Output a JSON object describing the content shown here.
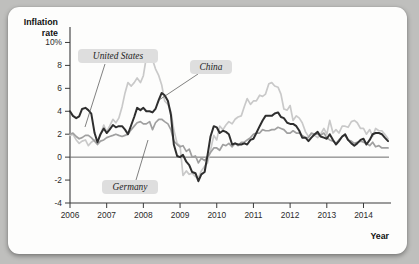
{
  "figure": {
    "background_color": "#bfbfbd",
    "card_color": "#fdfdfc"
  },
  "chart_data": {
    "type": "line",
    "title": "",
    "xlabel": "Year",
    "ylabel": "Inflation rate",
    "ylabel_line1": "Inflation",
    "ylabel_line2": "rate",
    "xlim": [
      2006,
      2014.75
    ],
    "ylim": [
      -4,
      11
    ],
    "grid": false,
    "zero_line": true,
    "legend_position": "inline-annotations",
    "ytick_labels": [
      "10%",
      "8",
      "6",
      "4",
      "2",
      "0",
      "-2",
      "-4"
    ],
    "ytick_values": [
      10,
      8,
      6,
      4,
      2,
      0,
      -2,
      -4
    ],
    "xtick_labels": [
      "2006",
      "2007",
      "2008",
      "2009",
      "2010",
      "2011",
      "2012",
      "2013",
      "2014"
    ],
    "xtick_values": [
      2006,
      2007,
      2008,
      2009,
      2010,
      2011,
      2012,
      2013,
      2014
    ],
    "annotations": [
      {
        "label": "United States",
        "series": "United States"
      },
      {
        "label": "China",
        "series": "China"
      },
      {
        "label": "Germany",
        "series": "Germany"
      }
    ],
    "series": [
      {
        "name": "United States",
        "color": "#2e2e2e",
        "x": [
          2006.0,
          2006.08,
          2006.17,
          2006.25,
          2006.33,
          2006.42,
          2006.5,
          2006.58,
          2006.67,
          2006.75,
          2006.83,
          2006.92,
          2007.0,
          2007.08,
          2007.17,
          2007.25,
          2007.33,
          2007.42,
          2007.5,
          2007.58,
          2007.67,
          2007.75,
          2007.83,
          2007.92,
          2008.0,
          2008.08,
          2008.17,
          2008.25,
          2008.33,
          2008.42,
          2008.5,
          2008.58,
          2008.67,
          2008.75,
          2008.83,
          2008.92,
          2009.0,
          2009.08,
          2009.17,
          2009.25,
          2009.33,
          2009.42,
          2009.5,
          2009.58,
          2009.67,
          2009.75,
          2009.83,
          2009.92,
          2010.0,
          2010.08,
          2010.17,
          2010.25,
          2010.33,
          2010.42,
          2010.5,
          2010.58,
          2010.67,
          2010.75,
          2010.83,
          2010.92,
          2011.0,
          2011.08,
          2011.17,
          2011.25,
          2011.33,
          2011.42,
          2011.5,
          2011.58,
          2011.67,
          2011.75,
          2011.83,
          2011.92,
          2012.0,
          2012.08,
          2012.17,
          2012.25,
          2012.33,
          2012.42,
          2012.5,
          2012.58,
          2012.67,
          2012.75,
          2012.83,
          2012.92,
          2013.0,
          2013.08,
          2013.17,
          2013.25,
          2013.33,
          2013.42,
          2013.5,
          2013.58,
          2013.67,
          2013.75,
          2013.83,
          2013.92,
          2014.0,
          2014.08,
          2014.17,
          2014.25,
          2014.33,
          2014.42,
          2014.5,
          2014.58,
          2014.67
        ],
        "y": [
          4.0,
          3.6,
          3.4,
          3.55,
          4.2,
          4.3,
          4.1,
          3.8,
          2.1,
          1.3,
          2.0,
          2.5,
          2.1,
          2.4,
          2.8,
          2.6,
          2.7,
          2.7,
          2.4,
          2.0,
          2.8,
          3.5,
          4.3,
          4.1,
          4.3,
          4.0,
          4.0,
          3.9,
          4.2,
          5.0,
          5.6,
          5.4,
          4.9,
          3.7,
          1.1,
          0.1,
          0.0,
          0.2,
          -0.4,
          -0.7,
          -1.3,
          -1.4,
          -2.1,
          -1.5,
          -1.3,
          0.2,
          1.8,
          2.7,
          2.6,
          2.1,
          2.3,
          2.2,
          2.0,
          1.1,
          1.2,
          1.1,
          1.1,
          1.2,
          1.1,
          1.5,
          1.6,
          2.1,
          2.7,
          3.2,
          3.6,
          3.6,
          3.6,
          3.8,
          3.9,
          3.5,
          3.4,
          3.0,
          2.9,
          2.9,
          2.7,
          2.3,
          1.7,
          1.7,
          1.4,
          1.7,
          2.0,
          2.2,
          1.8,
          1.7,
          1.6,
          2.0,
          1.5,
          1.1,
          1.4,
          1.8,
          2.0,
          1.5,
          1.2,
          1.0,
          1.2,
          1.5,
          1.6,
          1.1,
          1.5,
          2.0,
          2.1,
          2.1,
          2.0,
          1.7,
          1.4
        ]
      },
      {
        "name": "China",
        "color": "#c9c9c9",
        "x": [
          2006.0,
          2006.08,
          2006.17,
          2006.25,
          2006.33,
          2006.42,
          2006.5,
          2006.58,
          2006.67,
          2006.75,
          2006.83,
          2006.92,
          2007.0,
          2007.08,
          2007.17,
          2007.25,
          2007.33,
          2007.42,
          2007.5,
          2007.58,
          2007.67,
          2007.75,
          2007.83,
          2007.92,
          2008.0,
          2008.08,
          2008.17,
          2008.25,
          2008.33,
          2008.42,
          2008.5,
          2008.58,
          2008.67,
          2008.75,
          2008.83,
          2008.92,
          2009.0,
          2009.08,
          2009.17,
          2009.25,
          2009.33,
          2009.42,
          2009.5,
          2009.58,
          2009.67,
          2009.75,
          2009.83,
          2009.92,
          2010.0,
          2010.08,
          2010.17,
          2010.25,
          2010.33,
          2010.42,
          2010.5,
          2010.58,
          2010.67,
          2010.75,
          2010.83,
          2010.92,
          2011.0,
          2011.08,
          2011.17,
          2011.25,
          2011.33,
          2011.42,
          2011.5,
          2011.58,
          2011.67,
          2011.75,
          2011.83,
          2011.92,
          2012.0,
          2012.08,
          2012.17,
          2012.25,
          2012.33,
          2012.42,
          2012.5,
          2012.58,
          2012.67,
          2012.75,
          2012.83,
          2012.92,
          2013.0,
          2013.08,
          2013.17,
          2013.25,
          2013.33,
          2013.42,
          2013.5,
          2013.58,
          2013.67,
          2013.75,
          2013.83,
          2013.92,
          2014.0,
          2014.08,
          2014.17,
          2014.25,
          2014.33,
          2014.42,
          2014.5,
          2014.58,
          2014.67
        ],
        "y": [
          1.9,
          2.0,
          1.5,
          1.2,
          1.4,
          1.5,
          1.0,
          1.3,
          1.5,
          1.4,
          1.9,
          2.8,
          2.2,
          2.7,
          3.3,
          3.0,
          3.4,
          4.4,
          5.6,
          6.5,
          6.2,
          6.5,
          6.9,
          6.5,
          7.1,
          8.7,
          8.3,
          8.5,
          7.7,
          7.1,
          6.3,
          4.9,
          4.6,
          4.0,
          2.4,
          1.2,
          1.0,
          -1.6,
          -1.2,
          -1.5,
          -1.4,
          -1.7,
          -1.8,
          -1.2,
          -0.8,
          -0.5,
          0.6,
          1.9,
          1.5,
          2.7,
          2.4,
          2.8,
          3.1,
          2.9,
          3.3,
          3.5,
          3.6,
          4.4,
          5.1,
          4.6,
          4.9,
          4.9,
          5.4,
          5.3,
          5.5,
          6.4,
          6.5,
          6.2,
          6.1,
          5.5,
          4.2,
          4.1,
          4.5,
          3.2,
          3.6,
          3.4,
          3.0,
          2.2,
          1.8,
          2.0,
          1.9,
          1.7,
          2.0,
          2.5,
          2.0,
          3.2,
          2.1,
          2.4,
          2.1,
          2.7,
          2.7,
          2.6,
          3.1,
          3.2,
          3.0,
          2.5,
          2.5,
          2.0,
          2.4,
          1.8,
          2.5,
          2.3,
          2.3,
          2.0,
          1.6
        ]
      },
      {
        "name": "Germany",
        "color": "#a0a0a0",
        "x": [
          2006.0,
          2006.08,
          2006.17,
          2006.25,
          2006.33,
          2006.42,
          2006.5,
          2006.58,
          2006.67,
          2006.75,
          2006.83,
          2006.92,
          2007.0,
          2007.08,
          2007.17,
          2007.25,
          2007.33,
          2007.42,
          2007.5,
          2007.58,
          2007.67,
          2007.75,
          2007.83,
          2007.92,
          2008.0,
          2008.08,
          2008.17,
          2008.25,
          2008.33,
          2008.42,
          2008.5,
          2008.58,
          2008.67,
          2008.75,
          2008.83,
          2008.92,
          2009.0,
          2009.08,
          2009.17,
          2009.25,
          2009.33,
          2009.42,
          2009.5,
          2009.58,
          2009.67,
          2009.75,
          2009.83,
          2009.92,
          2010.0,
          2010.08,
          2010.17,
          2010.25,
          2010.33,
          2010.42,
          2010.5,
          2010.58,
          2010.67,
          2010.75,
          2010.83,
          2010.92,
          2011.0,
          2011.08,
          2011.17,
          2011.25,
          2011.33,
          2011.42,
          2011.5,
          2011.58,
          2011.67,
          2011.75,
          2011.83,
          2011.92,
          2012.0,
          2012.08,
          2012.17,
          2012.25,
          2012.33,
          2012.42,
          2012.5,
          2012.58,
          2012.67,
          2012.75,
          2012.83,
          2012.92,
          2013.0,
          2013.08,
          2013.17,
          2013.25,
          2013.33,
          2013.42,
          2013.5,
          2013.58,
          2013.67,
          2013.75,
          2013.83,
          2013.92,
          2014.0,
          2014.08,
          2014.17,
          2014.25,
          2014.33,
          2014.42,
          2014.5,
          2014.58,
          2014.67
        ],
        "y": [
          2.0,
          2.1,
          1.8,
          1.6,
          1.7,
          1.9,
          1.9,
          1.7,
          1.4,
          1.1,
          1.4,
          1.5,
          1.7,
          1.8,
          1.9,
          2.0,
          1.9,
          1.8,
          1.9,
          2.0,
          2.4,
          2.7,
          3.0,
          3.1,
          2.9,
          2.9,
          3.1,
          2.4,
          3.0,
          3.3,
          3.3,
          3.1,
          2.9,
          2.4,
          1.4,
          1.1,
          0.9,
          1.0,
          0.5,
          0.7,
          0.0,
          0.1,
          -0.5,
          -0.1,
          -0.3,
          0.0,
          0.4,
          0.8,
          0.8,
          0.6,
          1.1,
          1.0,
          1.2,
          0.9,
          1.2,
          1.0,
          1.3,
          1.3,
          1.5,
          1.7,
          2.0,
          2.1,
          2.1,
          2.4,
          2.3,
          2.3,
          2.4,
          2.4,
          2.6,
          2.5,
          2.4,
          2.1,
          2.1,
          2.3,
          2.1,
          2.1,
          1.9,
          1.7,
          1.7,
          2.1,
          2.0,
          2.0,
          1.9,
          2.1,
          1.7,
          1.5,
          1.4,
          1.2,
          1.5,
          1.8,
          1.9,
          1.5,
          1.4,
          1.2,
          1.3,
          1.4,
          1.3,
          1.2,
          1.0,
          1.3,
          0.9,
          1.0,
          0.8,
          0.8,
          0.8
        ]
      }
    ]
  }
}
